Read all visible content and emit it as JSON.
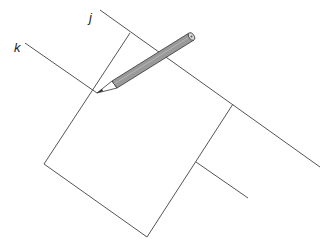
{
  "diagram": {
    "labels": {
      "j": "j",
      "k": "k"
    },
    "colors": {
      "line": "#555555",
      "pencil_body": "#999999",
      "pencil_outline": "#333333",
      "background": "#ffffff"
    }
  }
}
